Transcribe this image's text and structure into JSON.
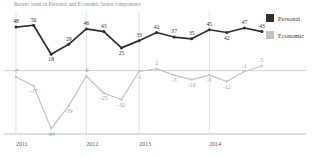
{
  "chart_data": {
    "type": "line",
    "title": "Recent trend in Personal and Economic Index components",
    "xlabel": "",
    "ylabel": "",
    "ylim": [
      -70,
      58
    ],
    "grid": "vertical",
    "legend_position": "right",
    "x": [
      "2011 Q1",
      "2011 Q2",
      "2011 Q3",
      "2011 Q4",
      "2012 Q1",
      "2012 Q2",
      "2012 Q3",
      "2013 Q1",
      "2013 Q2",
      "2013 Q3",
      "2013 Q4",
      "2014 Q1",
      "2014 Q2",
      "2014 Q3",
      "2014 Q4"
    ],
    "tick_labels": [
      "2011",
      "2012",
      "2013",
      "2014"
    ],
    "tick_index": [
      0,
      4,
      7,
      11
    ],
    "series": [
      {
        "name": "Personal",
        "color": "#2f2f2f",
        "values": [
          48,
          50,
          18,
          29,
          46,
          43,
          25,
          33,
          42,
          37,
          35,
          45,
          42,
          47,
          43
        ]
      },
      {
        "name": "Economic",
        "color": "#c2c2c2",
        "values": [
          -7,
          -17,
          -64,
          -39,
          -6,
          -25,
          -32,
          -1,
          2,
          -5,
          -10,
          -5,
          -12,
          -1,
          5
        ]
      }
    ]
  },
  "legend": {
    "items": [
      {
        "label": "Personal",
        "color": "#2f2f2f"
      },
      {
        "label": "Economic",
        "color": "#c2c2c2"
      }
    ]
  }
}
